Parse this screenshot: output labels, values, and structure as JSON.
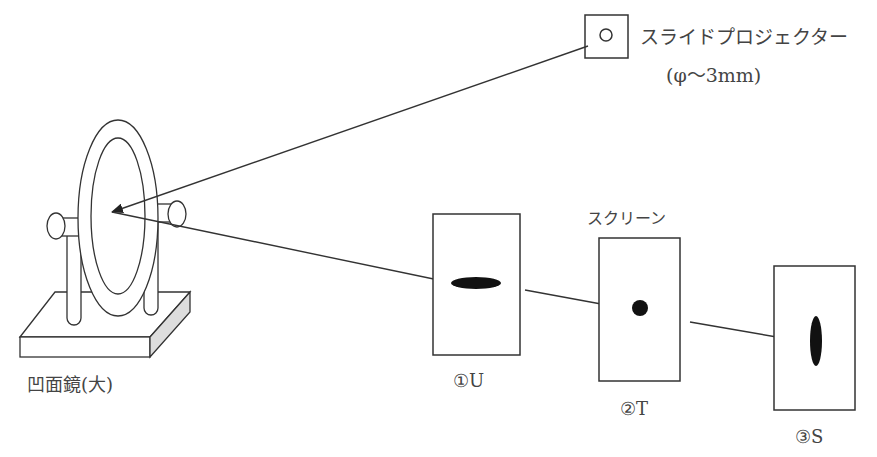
{
  "diagram": {
    "projector": {
      "label": "スライドプロジェクター",
      "spec": "(φ〜3mm)"
    },
    "mirror": {
      "label": "凹面鏡(大)"
    },
    "screen_caption": "スクリーン",
    "screens": [
      {
        "id": "U",
        "label": "①U",
        "spot": "horizontal-ellipse"
      },
      {
        "id": "T",
        "label": "②T",
        "spot": "circle"
      },
      {
        "id": "S",
        "label": "③S",
        "spot": "vertical-ellipse"
      }
    ],
    "colors": {
      "line": "#333333",
      "spot": "#111111",
      "text": "#444444"
    }
  }
}
